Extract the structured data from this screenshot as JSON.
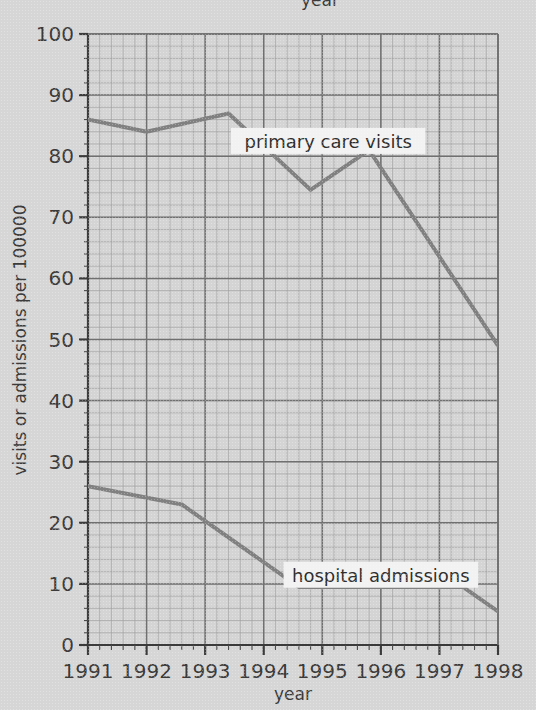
{
  "figure": {
    "top_cropped_label": "year",
    "background_color": "#d6d6d6",
    "line_color": "#808080",
    "grid_major_color": "#707070",
    "grid_minor_color": "#9a9a9a",
    "axis_color": "#3b3b3b"
  },
  "chart_data": {
    "type": "line",
    "title": "",
    "xlabel": "year",
    "ylabel": "visits or admissions per 100000",
    "xlim": [
      1991,
      1998
    ],
    "ylim": [
      0,
      100
    ],
    "xticks": [
      1991,
      1992,
      1993,
      1994,
      1995,
      1996,
      1997,
      1998
    ],
    "xticklabels": [
      "1991",
      "1992",
      "1993",
      "1994",
      "1995",
      "1996",
      "1997",
      "1998"
    ],
    "yticks": [
      0,
      10,
      20,
      30,
      40,
      50,
      60,
      70,
      80,
      90,
      100
    ],
    "yticklabels": [
      "0",
      "10",
      "20",
      "30",
      "40",
      "50",
      "60",
      "70",
      "80",
      "90",
      "100"
    ],
    "grid": true,
    "grid_minor_x_step": 0.2,
    "grid_minor_y_step": 2,
    "grid_major_x_step": 1,
    "grid_major_y_step": 10,
    "legend_position": "inline-annotations",
    "series": [
      {
        "name": "primary care visits",
        "label": "primary care visits",
        "x": [
          1991,
          1992,
          1993.4,
          1994.8,
          1995.8,
          1998
        ],
        "values": [
          86,
          84,
          87,
          74.5,
          81,
          49
        ]
      },
      {
        "name": "hospital admissions",
        "label": "hospital admissions",
        "x": [
          1991,
          1992.6,
          1994.6,
          1997.4,
          1998
        ],
        "values": [
          26,
          23,
          9.5,
          9.5,
          5.5
        ]
      }
    ],
    "annotations": [
      {
        "text": "primary care visits",
        "x": 1995.1,
        "y": 82.5
      },
      {
        "text": "hospital admissions",
        "x": 1996.0,
        "y": 11.5
      }
    ]
  },
  "axes": {
    "y_axis_title": "visits or admissions per 100000",
    "x_axis_title": "year"
  }
}
